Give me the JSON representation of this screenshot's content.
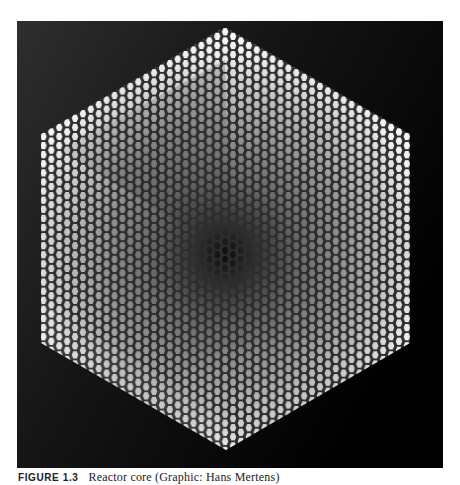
{
  "figure": {
    "background_color": "#000000",
    "cell_shape": "hexagon",
    "core_shape": "hexagon",
    "shading": {
      "edge_color": "#f2f2f2",
      "mid_color": "#8a8a8a",
      "center_color": "#0e0e0e",
      "cell_border_color": "#3a3a3a"
    }
  },
  "caption": {
    "label": "FIGURE 1.3",
    "text": "Reactor core (Graphic: Hans Mertens)"
  }
}
